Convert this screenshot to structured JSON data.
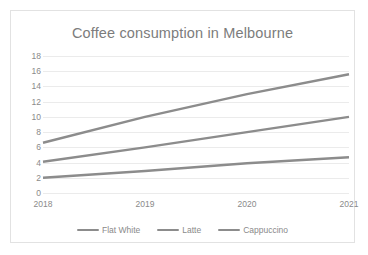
{
  "chart_data": {
    "type": "line",
    "title": "Coffee consumption in Melbourne",
    "xlabel": "",
    "ylabel": "",
    "categories": [
      "2018",
      "2019",
      "2020",
      "2021"
    ],
    "x": [
      2018,
      2019,
      2020,
      2021
    ],
    "ylim": [
      0,
      18
    ],
    "ytick_step": 2,
    "yticks": [
      18,
      16,
      14,
      12,
      10,
      8,
      6,
      4,
      2,
      0
    ],
    "grid": true,
    "legend_position": "bottom",
    "series": [
      {
        "name": "Flat White",
        "color": "#8c8c8c",
        "values": [
          2.0,
          2.9,
          3.9,
          4.7
        ]
      },
      {
        "name": "Latte",
        "color": "#8c8c8c",
        "values": [
          4.1,
          6.0,
          8.0,
          10.0
        ]
      },
      {
        "name": "Cappuccino",
        "color": "#8c8c8c",
        "values": [
          6.6,
          10.0,
          13.0,
          15.6
        ]
      }
    ]
  },
  "colors": {
    "border": "#e2e2e2",
    "gridline": "#ebebeb",
    "text": "#8a8a8a",
    "title": "#7c7c7c",
    "line": "#8c8c8c",
    "background": "#ffffff"
  }
}
